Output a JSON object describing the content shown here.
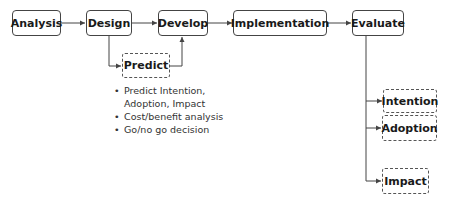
{
  "main_flow": [
    {
      "id": "analysis",
      "label": "Analysis"
    },
    {
      "id": "design",
      "label": "Design"
    },
    {
      "id": "develop",
      "label": "Develop"
    },
    {
      "id": "implementation",
      "label": "Implementation"
    },
    {
      "id": "evaluate",
      "label": "Evaluate"
    }
  ],
  "predict": {
    "label": "Predict",
    "notes": [
      "Predict Intention, Adoption, Impact",
      "Cost/benefit analysis",
      "Go/no go decision"
    ]
  },
  "evaluate_outcomes": [
    {
      "id": "intention",
      "label": "Intention"
    },
    {
      "id": "adoption",
      "label": "Adoption"
    },
    {
      "id": "impact",
      "label": "Impact"
    }
  ],
  "colors": {
    "stroke": "#444444",
    "text": "#1a1a1a",
    "background": "#ffffff"
  }
}
